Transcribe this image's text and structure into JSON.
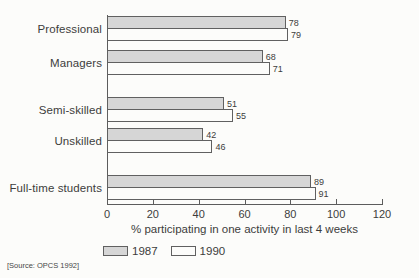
{
  "chart_data": {
    "type": "bar",
    "orientation": "horizontal",
    "categories": [
      "Professional",
      "Managers",
      "Semi-skilled",
      "Unskilled",
      "Full-time students"
    ],
    "series": [
      {
        "name": "1987",
        "values": [
          78,
          68,
          51,
          42,
          89
        ],
        "color": "#d6d6d6"
      },
      {
        "name": "1990",
        "values": [
          79,
          71,
          55,
          46,
          91
        ],
        "color": "#fcfcfa"
      }
    ],
    "xlabel": "% participating in one activity in last 4 weeks",
    "xlim": [
      0,
      120
    ],
    "xticks": [
      0,
      20,
      40,
      60,
      80,
      100,
      120
    ],
    "grid": false,
    "legend_position": "bottom"
  },
  "source_note": "[Source: OPCS 1992]",
  "colors": {
    "bar_1987": "#d6d6d6",
    "bar_1990": "#fcfcfa",
    "outline": "#606060",
    "text": "#3c3c3c"
  }
}
